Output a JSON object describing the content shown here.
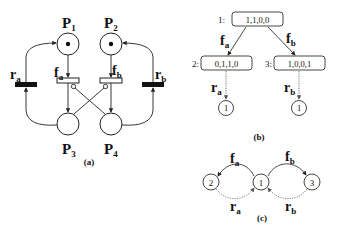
{
  "panel_a": {
    "caption": "(a)",
    "places": [
      {
        "id": "P1",
        "label": "P",
        "sub": "1",
        "tokens": 1
      },
      {
        "id": "P2",
        "label": "P",
        "sub": "2",
        "tokens": 1
      },
      {
        "id": "P3",
        "label": "P",
        "sub": "3",
        "tokens": 0
      },
      {
        "id": "P4",
        "label": "P",
        "sub": "4",
        "tokens": 0
      }
    ],
    "transitions": [
      {
        "id": "fa",
        "label": "f",
        "sub": "a",
        "type": "immediate-hollow"
      },
      {
        "id": "fb",
        "label": "f",
        "sub": "b",
        "type": "immediate-hollow"
      },
      {
        "id": "ra",
        "label": "r",
        "sub": "a",
        "type": "timed-filled"
      },
      {
        "id": "rb",
        "label": "r",
        "sub": "b",
        "type": "timed-filled"
      }
    ]
  },
  "panel_b": {
    "caption": "(b)",
    "nodes": [
      {
        "index": "1:",
        "marking": "1,1,0,0"
      },
      {
        "index": "2:",
        "marking": "0,1,1,0"
      },
      {
        "index": "3:",
        "marking": "1,0,0,1"
      }
    ],
    "edges": [
      {
        "from": "1",
        "to": "2",
        "label": "f",
        "sub": "a",
        "style": "solid"
      },
      {
        "from": "1",
        "to": "3",
        "label": "f",
        "sub": "b",
        "style": "solid"
      },
      {
        "from": "2",
        "to": "leaf-1a",
        "label": "r",
        "sub": "a",
        "style": "dotted"
      },
      {
        "from": "3",
        "to": "leaf-1b",
        "label": "r",
        "sub": "b",
        "style": "dotted"
      }
    ],
    "leaves": [
      "1",
      "1"
    ]
  },
  "panel_c": {
    "caption": "(c)",
    "states": [
      "2",
      "1",
      "3"
    ],
    "edges": [
      {
        "label": "f",
        "sub": "a",
        "style": "solid"
      },
      {
        "label": "f",
        "sub": "b",
        "style": "solid"
      },
      {
        "label": "r",
        "sub": "a",
        "style": "dotted"
      },
      {
        "label": "r",
        "sub": "b",
        "style": "dotted"
      }
    ]
  }
}
